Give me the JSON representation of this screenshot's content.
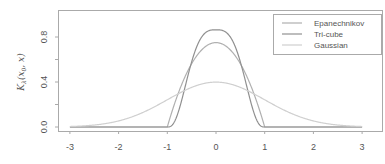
{
  "chart_data": {
    "type": "line",
    "title": "",
    "xlabel": "",
    "ylabel": "K_λ(x_0, x)",
    "xlim": [
      -3,
      3
    ],
    "ylim": [
      0,
      0.9
    ],
    "x_ticks": [
      "-3",
      "-2",
      "-1",
      "0",
      "1",
      "2",
      "3"
    ],
    "y_ticks": [
      "0.0",
      "0.4",
      "0.8"
    ],
    "grid": false,
    "legend_position": "top-right",
    "series": [
      {
        "name": "Epanechnikov",
        "color": "#b0b0b0",
        "formula": "0.75*(1-t^2) for |t|<=1 else 0",
        "peak": 0.75
      },
      {
        "name": "Tri-cube",
        "color": "#909090",
        "formula": "(70/81)*(1-|t|^3)^3 for |t|<=1 else 0",
        "peak": 0.864
      },
      {
        "name": "Gaussian",
        "color": "#cfcfcf",
        "formula": "standard normal density",
        "peak": 0.399
      }
    ],
    "sample_x": [
      -3,
      -2,
      -1,
      -0.5,
      0,
      0.5,
      1,
      2,
      3
    ],
    "sample_values": {
      "Epanechnikov": [
        0,
        0,
        0,
        0.5625,
        0.75,
        0.5625,
        0,
        0,
        0
      ],
      "Tri-cube": [
        0,
        0,
        0,
        0.578,
        0.864,
        0.578,
        0,
        0,
        0
      ],
      "Gaussian": [
        0.004,
        0.054,
        0.242,
        0.352,
        0.399,
        0.352,
        0.242,
        0.054,
        0.004
      ]
    }
  },
  "axis": {
    "ylabel_main": "K",
    "ylabel_sub": "λ",
    "ylabel_args": "(x",
    "ylabel_args_sub": "0",
    "ylabel_args_end": ", x)"
  },
  "legend": {
    "items": [
      {
        "label": "Epanechnikov",
        "color": "#b0b0b0"
      },
      {
        "label": "Tri-cube",
        "color": "#909090"
      },
      {
        "label": "Gaussian",
        "color": "#cfcfcf"
      }
    ]
  }
}
